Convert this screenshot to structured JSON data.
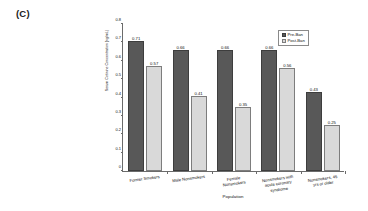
{
  "panel": {
    "label": "(C)"
  },
  "chart_data": {
    "type": "bar",
    "title": "",
    "xlabel": "Population",
    "ylabel": "Serum Cotinine Concentration (ng/mL)",
    "ylim": [
      0,
      0.8
    ],
    "ytick_values": [
      0,
      0.1,
      0.2,
      0.3,
      0.4,
      0.5,
      0.6,
      0.7,
      0.8
    ],
    "ytick_labels": [
      "0",
      "0.1",
      "0.2",
      "0.3",
      "0.4",
      "0.5",
      "0.6",
      "0.7",
      "0.8"
    ],
    "grid": false,
    "legend_position": "top-right",
    "categories": [
      "Former Smokers",
      "Male Nonsmokers",
      "Female Nonsmokers",
      "Nonsmokers with acute coronary syndrome",
      "Nonsmokers, 45 yrs or older"
    ],
    "category_lines": [
      [
        "Former Smokers"
      ],
      [
        "Male Nonsmokers"
      ],
      [
        "Female",
        "Nonsmokers"
      ],
      [
        "Nonsmokers with",
        "acute coronary",
        "syndrome"
      ],
      [
        "Nonsmokers, 45",
        "yrs or older"
      ]
    ],
    "series": [
      {
        "name": "Pre-Ban",
        "color": "#585858",
        "values": [
          0.71,
          0.66,
          0.66,
          0.66,
          0.43
        ],
        "labels": [
          "0.71",
          "0.66",
          "0.66",
          "0.66",
          "0.43"
        ]
      },
      {
        "name": "Post-Ban",
        "color": "#d9d9d9",
        "values": [
          0.57,
          0.41,
          0.35,
          0.56,
          0.25
        ],
        "labels": [
          "0.57",
          "0.41",
          "0.35",
          "0.56",
          "0.25"
        ]
      }
    ]
  }
}
